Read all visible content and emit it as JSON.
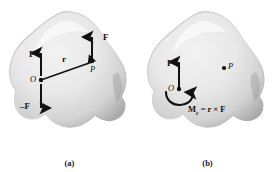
{
  "figure": {
    "title_implicit": "Force-couple system equivalence",
    "background_color": "#ffffff",
    "body_fill_light": "#ebebeb",
    "body_fill_mid": "#d4d4d4",
    "body_fill_edge": "#9a9a9a",
    "ink_color": "#111111"
  },
  "panel_a": {
    "caption": "(a)",
    "labels": {
      "force_up_at_p": "F",
      "force_up_at_o": "F",
      "force_down_at_o": "–F",
      "position_vector": "r",
      "point_o": "O",
      "point_p": "P"
    }
  },
  "panel_b": {
    "caption": "(b)",
    "labels": {
      "force_up_at_o": "F",
      "point_o": "O",
      "point_p": "P"
    },
    "moment_equation": {
      "symbol": "M",
      "subscript": "c",
      "equals": "=",
      "r": "r",
      "cross": "×",
      "f": "F",
      "full_text": "Mᴄ = r × F"
    }
  }
}
